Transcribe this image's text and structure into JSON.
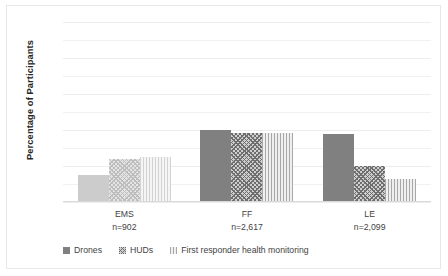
{
  "chart_data": {
    "type": "bar",
    "title": "",
    "xlabel": "",
    "ylabel": "Percentage of Participants",
    "ylim": [
      0,
      100
    ],
    "ytick_labels": [
      "0%",
      "20%",
      "40%",
      "60%",
      "80%",
      "100%"
    ],
    "ytick_values": [
      0,
      20,
      40,
      60,
      80,
      100
    ],
    "grid": true,
    "gridlines_minor_step": 10,
    "legend_position": "bottom",
    "categories": [
      "EMS",
      "FF",
      "LE"
    ],
    "category_sublabels": [
      "n=902",
      "n=2,617",
      "n=2,099"
    ],
    "series": [
      {
        "name": "Drones",
        "values": [
          15,
          40,
          38
        ],
        "fill": "solid",
        "color": "#808080"
      },
      {
        "name": "HUDs",
        "values": [
          24,
          38.5,
          20
        ],
        "fill": "crosshatch",
        "color": "#cfcfcf"
      },
      {
        "name": "First responder health monitoring",
        "values": [
          25,
          38.5,
          13
        ],
        "fill": "vertical",
        "color": "#efefef"
      }
    ]
  },
  "axis": {
    "y_title": "Percentage of Participants",
    "ticks": [
      {
        "label": "100%",
        "value": 100
      },
      {
        "label": "80%",
        "value": 80
      },
      {
        "label": "60%",
        "value": 60
      },
      {
        "label": "40%",
        "value": 40
      },
      {
        "label": "20%",
        "value": 20
      },
      {
        "label": "0%",
        "value": 0
      }
    ]
  },
  "categories": [
    {
      "name": "EMS",
      "n_label": "n=902"
    },
    {
      "name": "FF",
      "n_label": "n=2,617"
    },
    {
      "name": "LE",
      "n_label": "n=2,099"
    }
  ],
  "legend": {
    "items": [
      {
        "label": "Drones"
      },
      {
        "label": "HUDs"
      },
      {
        "label": "First responder health monitoring"
      }
    ]
  }
}
